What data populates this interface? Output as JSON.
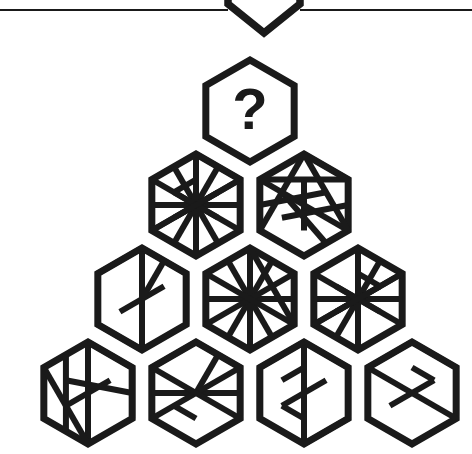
{
  "page": {
    "background_color": "#ffffff",
    "ink_color": "#1a1a1a",
    "width": 472,
    "height": 454
  },
  "top_divider": {
    "name": "horizontal-rule",
    "y": 10,
    "left_segment": [
      0,
      228
    ],
    "right_segment": [
      300,
      472
    ],
    "stroke_width": 2.2
  },
  "partial_hexagon_above": {
    "label": "",
    "description": "bottom vertex of a hexagon cropped by the top edge",
    "apex_x": 264,
    "bottom_y": 33,
    "left_x": 228,
    "right_x": 300
  },
  "puzzle": {
    "type": "hexagon-pattern-pyramid",
    "rows": 4,
    "hex_radius": 51,
    "orientation": "pointy-top",
    "missing_tile_label": "?",
    "rows_data": [
      {
        "row": 1,
        "count": 1,
        "tiles": [
          {
            "id": "r1c1",
            "name": "hex-question",
            "cx": 250,
            "cy": 111,
            "label": "?",
            "is_question": true,
            "pattern": []
          }
        ]
      },
      {
        "row": 2,
        "count": 2,
        "tiles": [
          {
            "id": "r2c1",
            "name": "hex-r2-left",
            "cx": 196,
            "cy": 205,
            "label": "",
            "is_question": false,
            "pattern": [
              [
                0,
                1,
                3,
                4
              ],
              [
                0,
                2,
                3,
                5
              ],
              [
                1,
                2,
                4,
                5
              ],
              [
                2,
                3,
                5,
                0
              ],
              [
                1,
                3,
                4,
                0
              ],
              [
                0,
                4,
                1,
                5
              ]
            ]
          },
          {
            "id": "r2c2",
            "name": "hex-r2-right",
            "cx": 304,
            "cy": 205,
            "label": "",
            "is_question": false,
            "pattern": [
              [
                0,
                3,
                1,
                4
              ],
              [
                5,
                1,
                2,
                4
              ],
              [
                0,
                2,
                4,
                5
              ],
              [
                5,
                3,
                1,
                2
              ],
              [
                0,
                4,
                2,
                3
              ]
            ]
          }
        ]
      },
      {
        "row": 3,
        "count": 3,
        "tiles": [
          {
            "id": "r3c1",
            "name": "hex-r3-left",
            "cx": 142,
            "cy": 299,
            "label": "",
            "is_question": false,
            "pattern": [
              [
                0,
                2,
                3,
                5
              ],
              [
                0,
                3,
                1,
                4
              ],
              [
                1,
                5,
                2,
                4
              ],
              [
                5,
                2,
                0,
                1
              ],
              [
                4,
                1,
                3,
                0
              ]
            ]
          },
          {
            "id": "r3c2",
            "name": "hex-r3-middle",
            "cx": 250,
            "cy": 299,
            "label": "",
            "is_question": false,
            "pattern": [
              [
                0,
                1,
                3,
                4
              ],
              [
                1,
                2,
                4,
                5
              ],
              [
                5,
                0,
                2,
                3
              ],
              [
                0,
                3,
                2,
                5
              ]
            ]
          },
          {
            "id": "r3c3",
            "name": "hex-r3-right",
            "cx": 358,
            "cy": 299,
            "label": "",
            "is_question": false,
            "pattern": [
              [
                0,
                1,
                3,
                4
              ],
              [
                1,
                2,
                4,
                5
              ],
              [
                0,
                2,
                3,
                5
              ],
              [
                5,
                1,
                2,
                0
              ],
              [
                4,
                0,
                1,
                3
              ]
            ]
          }
        ]
      },
      {
        "row": 4,
        "count": 4,
        "tiles": [
          {
            "id": "r4c1",
            "name": "hex-r4-1",
            "cx": 88,
            "cy": 393,
            "label": "",
            "is_question": false,
            "pattern": [
              [
                0,
                2,
                3,
                5
              ],
              [
                1,
                4,
                2,
                5
              ],
              [
                5,
                0,
                3,
                4
              ],
              [
                0,
                4,
                1,
                2
              ]
            ]
          },
          {
            "id": "r4c2",
            "name": "hex-r4-2",
            "cx": 196,
            "cy": 393,
            "label": "",
            "is_question": false,
            "pattern": [
              [
                0,
                3,
                1,
                4
              ],
              [
                1,
                2,
                4,
                5
              ],
              [
                5,
                2,
                0,
                1
              ],
              [
                5,
                3,
                2,
                4
              ]
            ]
          },
          {
            "id": "r4c3",
            "name": "hex-r4-3",
            "cx": 304,
            "cy": 393,
            "label": "",
            "is_question": false,
            "pattern": [
              [
                0,
                3,
                1,
                4
              ],
              [
                5,
                2,
                4,
                1
              ],
              [
                0,
                2,
                3,
                5
              ],
              [
                5,
                1,
                0,
                4
              ],
              [
                2,
                4,
                3,
                5
              ]
            ]
          },
          {
            "id": "r4c4",
            "name": "hex-r4-4",
            "cx": 412,
            "cy": 393,
            "label": "",
            "is_question": false,
            "pattern": [
              [
                0,
                3,
                1,
                4
              ],
              [
                5,
                1,
                2,
                0
              ],
              [
                0,
                2,
                5,
                3
              ]
            ]
          }
        ]
      }
    ]
  }
}
